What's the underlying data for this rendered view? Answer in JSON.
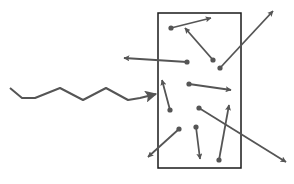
{
  "diagram": {
    "colors": {
      "background": "#ffffff",
      "box_stroke": "#1a1a1a",
      "arrow": "#555555",
      "wave": "#555555"
    },
    "box": {
      "x": 158,
      "y": 13,
      "width": 83,
      "height": 155
    },
    "incident_wave": {
      "label": "wavy-arrow",
      "points": [
        [
          10,
          88
        ],
        [
          22,
          98
        ],
        [
          35,
          98
        ],
        [
          60,
          88
        ],
        [
          83,
          100
        ],
        [
          106,
          88
        ],
        [
          128,
          100
        ],
        [
          140,
          98
        ],
        [
          156,
          94
        ]
      ],
      "arrow_tip": [
        156,
        94
      ]
    },
    "particles": [
      {
        "from": [
          171,
          28
        ],
        "to": [
          211,
          18
        ]
      },
      {
        "from": [
          213,
          60
        ],
        "to": [
          185,
          28
        ]
      },
      {
        "from": [
          187,
          62
        ],
        "to": [
          124,
          58
        ]
      },
      {
        "from": [
          220,
          68
        ],
        "to": [
          273,
          11
        ]
      },
      {
        "from": [
          189,
          84
        ],
        "to": [
          231,
          90
        ]
      },
      {
        "from": [
          170,
          110
        ],
        "to": [
          162,
          80
        ]
      },
      {
        "from": [
          199,
          108
        ],
        "to": [
          286,
          162
        ]
      },
      {
        "from": [
          179,
          129
        ],
        "to": [
          148,
          157
        ]
      },
      {
        "from": [
          196,
          127
        ],
        "to": [
          200,
          159
        ]
      },
      {
        "from": [
          219,
          160
        ],
        "to": [
          229,
          105
        ]
      }
    ]
  }
}
